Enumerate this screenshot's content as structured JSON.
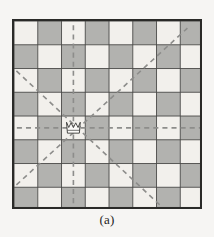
{
  "figure": {
    "label": "queen-attack-diagram",
    "caption": "(a)"
  },
  "board": {
    "rows": 8,
    "cols": 8,
    "square_size": 23.5,
    "light_color": "#f2f0ec",
    "dark_color": "#b2b2af",
    "grid_line_color": "#4a4a48",
    "border_color": "#2a2a28",
    "border_width": 2,
    "grid_width": 0.9,
    "pattern_note": "square (r,c) is dark when (r + c) is odd; row 0 col 0 is light",
    "squares": [
      [
        "light",
        "dark",
        "light",
        "dark",
        "light",
        "dark",
        "light",
        "dark"
      ],
      [
        "dark",
        "light",
        "dark",
        "light",
        "dark",
        "light",
        "dark",
        "light"
      ],
      [
        "light",
        "dark",
        "light",
        "dark",
        "light",
        "dark",
        "light",
        "dark"
      ],
      [
        "dark",
        "light",
        "dark",
        "light",
        "dark",
        "light",
        "dark",
        "light"
      ],
      [
        "light",
        "dark",
        "light",
        "dark",
        "light",
        "dark",
        "light",
        "dark"
      ],
      [
        "dark",
        "light",
        "dark",
        "light",
        "dark",
        "light",
        "dark",
        "light"
      ],
      [
        "light",
        "dark",
        "light",
        "dark",
        "light",
        "dark",
        "light",
        "dark"
      ],
      [
        "dark",
        "light",
        "dark",
        "light",
        "dark",
        "light",
        "dark",
        "light"
      ]
    ]
  },
  "piece": {
    "type": "queen",
    "glyph_name": "queen-crown-icon",
    "row": 4,
    "col": 2,
    "fill_color": "#fbfaf8",
    "outline_color": "#3a3a38"
  },
  "attack_lines": {
    "color": "#8d8d8b",
    "width": 1.6,
    "dash": "5,4",
    "lines": [
      {
        "name": "vertical-file-line",
        "direction": "vertical",
        "x1": 2.5,
        "y1": 0.18,
        "x2": 2.5,
        "y2": 7.85
      },
      {
        "name": "horizontal-rank-line",
        "direction": "horizontal",
        "x1": 0.12,
        "y1": 4.5,
        "x2": 7.9,
        "y2": 4.5
      },
      {
        "name": "diagonal-up-right-line",
        "direction": "diagonal-up-right",
        "x1": 0.1,
        "y1": 6.9,
        "x2": 7.3,
        "y2": 0.3
      },
      {
        "name": "diagonal-down-right-line",
        "direction": "diagonal-down-right",
        "x1": 0.1,
        "y1": 2.1,
        "x2": 6.2,
        "y2": 7.8
      }
    ]
  }
}
